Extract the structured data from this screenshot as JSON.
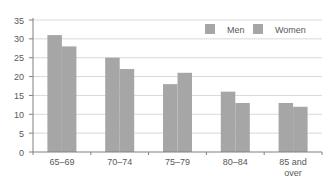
{
  "chart_data": {
    "type": "bar",
    "title": "",
    "xlabel": "",
    "ylabel": "",
    "categories": [
      "65–69",
      "70–74",
      "75–79",
      "80–84",
      "85 and over"
    ],
    "category_lines": [
      [
        "65–69"
      ],
      [
        "70–74"
      ],
      [
        "75–79"
      ],
      [
        "80–84"
      ],
      [
        "85 and",
        "over"
      ]
    ],
    "series": [
      {
        "name": "Men",
        "values": [
          31,
          25,
          18,
          16,
          13
        ],
        "color": "#a6a6a6"
      },
      {
        "name": "Women",
        "values": [
          28,
          22,
          21,
          13,
          12
        ],
        "color": "#a6a6a6"
      }
    ],
    "ylim": [
      0,
      35
    ],
    "yticks": [
      0,
      5,
      10,
      15,
      20,
      25,
      30,
      35
    ],
    "grid": true,
    "legend_position": "top-right"
  },
  "colors": {
    "grid": "#d9d9d9",
    "axis": "#808080",
    "text": "#595959",
    "legend_line": "#d9d9d9"
  }
}
